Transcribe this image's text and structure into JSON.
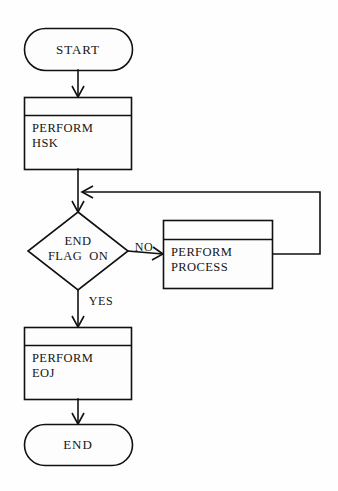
{
  "diagram": {
    "type": "flowchart",
    "colors": {
      "background": "#fefefe",
      "stroke": "#111111",
      "shape_fill": "#fdfdfd",
      "text": "#151515"
    },
    "nodes": [
      {
        "id": "start",
        "shape": "terminator",
        "label": "START",
        "line1": "START"
      },
      {
        "id": "perform-hsk",
        "shape": "predefined-process",
        "label": "PERFORM HSK",
        "line1": "PERFORM",
        "line2": "HSK"
      },
      {
        "id": "end-flag-decision",
        "shape": "decision",
        "label": "END FLAG ON",
        "line1": "END",
        "line2": "FLAG  ON"
      },
      {
        "id": "perform-process",
        "shape": "predefined-process",
        "label": "PERFORM PROCESS",
        "line1": "PERFORM",
        "line2": "PROCESS"
      },
      {
        "id": "perform-eoj",
        "shape": "predefined-process",
        "label": "PERFORM EOJ",
        "line1": "PERFORM",
        "line2": "EOJ"
      },
      {
        "id": "end",
        "shape": "terminator",
        "label": "END",
        "line1": "END"
      }
    ],
    "edges": [
      {
        "id": "start-to-hsk",
        "from": "start",
        "to": "perform-hsk",
        "label": ""
      },
      {
        "id": "hsk-to-decision",
        "from": "perform-hsk",
        "to": "end-flag-decision",
        "label": ""
      },
      {
        "id": "decision-no-to-process",
        "from": "end-flag-decision",
        "to": "perform-process",
        "label": "NO"
      },
      {
        "id": "process-loop-back",
        "from": "perform-process",
        "to": "hsk-to-decision",
        "label": ""
      },
      {
        "id": "decision-yes-to-eoj",
        "from": "end-flag-decision",
        "to": "perform-eoj",
        "label": "YES"
      },
      {
        "id": "eoj-to-end",
        "from": "perform-eoj",
        "to": "end",
        "label": ""
      }
    ]
  }
}
